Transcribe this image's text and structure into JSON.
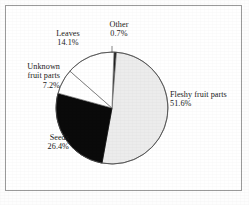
{
  "figure": {
    "background_color": "#ffffff",
    "frame_color": "#9a9a9a"
  },
  "chart_data": {
    "type": "pie",
    "title": "",
    "xlabel": "",
    "ylabel": "",
    "legend_position": "none",
    "grid": false,
    "center": {
      "x": 112,
      "y": 108
    },
    "radius": 56,
    "start_angle_deg": -88,
    "direction": "clockwise",
    "categories": [
      "Other",
      "Fleshy fruit parts",
      "Seeds",
      "Unknown fruit parts",
      "Leaves"
    ],
    "values": [
      0.7,
      51.6,
      26.4,
      7.2,
      14.1
    ],
    "value_suffix": "%",
    "slices": [
      {
        "name": "Other",
        "label": "Other",
        "value": "0.7%",
        "value_number": 0.7,
        "fill": "#1a1a1a",
        "stroke": "#4a4a4a"
      },
      {
        "name": "Fleshy fruit parts",
        "label": "Fleshy fruit parts",
        "value": "51.6%",
        "value_number": 51.6,
        "fill": "#ececec",
        "stroke": "#5a5a5a"
      },
      {
        "name": "Seeds",
        "label": "Seeds",
        "value": "26.4%",
        "value_number": 26.4,
        "fill": "#0a0a0a",
        "stroke": "#0a0a0a"
      },
      {
        "name": "Unknown fruit parts",
        "label": "Unknown fruit parts",
        "label_line1": "Unknown",
        "label_line2": "fruit parts",
        "value": "7.2%",
        "value_number": 7.2,
        "fill": "#ffffff",
        "stroke": "#6a6a6a"
      },
      {
        "name": "Leaves",
        "label": "Leaves",
        "value": "14.1%",
        "value_number": 14.1,
        "fill": "#ffffff",
        "stroke": "#6a6a6a"
      }
    ]
  },
  "labels": {
    "other": {
      "text": "Other",
      "value": "0.7%"
    },
    "leaves": {
      "text": "Leaves",
      "value": "14.1%"
    },
    "unknown": {
      "line1": "Unknown",
      "line2": "fruit parts",
      "value": "7.2%"
    },
    "seeds": {
      "text": "Seeds",
      "value": "26.4%"
    },
    "fleshy": {
      "text": "Fleshy fruit parts",
      "value": "51.6%"
    }
  }
}
